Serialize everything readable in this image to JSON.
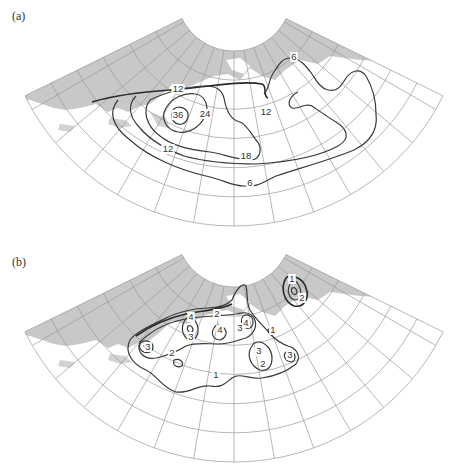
{
  "figure": {
    "panels": [
      {
        "id": "a",
        "label": "(a)",
        "label_pos": [
          12,
          20
        ],
        "contour_labels": [
          {
            "text": "12",
            "x": 178,
            "y": 92
          },
          {
            "text": "36",
            "x": 178,
            "y": 118
          },
          {
            "text": "24",
            "x": 205,
            "y": 117
          },
          {
            "text": "12",
            "x": 266,
            "y": 115
          },
          {
            "text": "12",
            "x": 168,
            "y": 152
          },
          {
            "text": "18",
            "x": 246,
            "y": 159
          },
          {
            "text": "6",
            "x": 250,
            "y": 186
          },
          {
            "text": "6",
            "x": 294,
            "y": 60
          }
        ]
      },
      {
        "id": "b",
        "label": "(b)",
        "label_pos": [
          12,
          265
        ],
        "contour_labels": [
          {
            "text": "1",
            "x": 292,
            "y": 282
          },
          {
            "text": "2",
            "x": 302,
            "y": 301
          },
          {
            "text": "2",
            "x": 217,
            "y": 317
          },
          {
            "text": "4",
            "x": 191,
            "y": 320
          },
          {
            "text": "4",
            "x": 220,
            "y": 333
          },
          {
            "text": "3",
            "x": 240,
            "y": 331
          },
          {
            "text": "4",
            "x": 246,
            "y": 326
          },
          {
            "text": "3",
            "x": 191,
            "y": 340
          },
          {
            "text": "1",
            "x": 273,
            "y": 333
          },
          {
            "text": "3",
            "x": 148,
            "y": 350
          },
          {
            "text": "2",
            "x": 172,
            "y": 356
          },
          {
            "text": "3",
            "x": 259,
            "y": 354
          },
          {
            "text": "2",
            "x": 263,
            "y": 367
          },
          {
            "text": "3",
            "x": 290,
            "y": 358
          },
          {
            "text": "1",
            "x": 216,
            "y": 378
          }
        ]
      }
    ],
    "map": {
      "projection": "conic-fan",
      "inner_radius": 58,
      "outer_radius": 233,
      "half_angle_deg": 63.8,
      "meridian_step_deg": 10,
      "parallel_rings": 6,
      "land_color": "#c8c8c8",
      "grid_color": "#9a9a9a",
      "contour_color": "#333333"
    }
  }
}
